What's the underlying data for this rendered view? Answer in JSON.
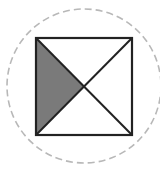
{
  "diagram": {
    "circle": {
      "cx": 84,
      "cy": 86,
      "r": 77,
      "stroke": "#b8b8b8",
      "style": "dashed"
    },
    "square": {
      "x1": 36,
      "y1": 38,
      "x2": 132,
      "y2": 135,
      "stroke": "#222222"
    },
    "diagonals": [
      {
        "from": [
          36,
          38
        ],
        "to": [
          132,
          135
        ]
      },
      {
        "from": [
          132,
          38
        ],
        "to": [
          36,
          135
        ]
      }
    ],
    "shaded_region": {
      "name": "left-triangle",
      "fill": "#7a7a7a",
      "points": [
        [
          36,
          38
        ],
        [
          84,
          86.5
        ],
        [
          36,
          135
        ]
      ]
    }
  }
}
